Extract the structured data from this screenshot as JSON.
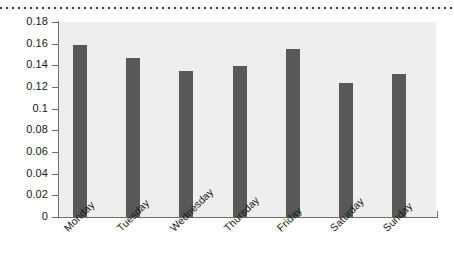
{
  "decor": {
    "top_rule_name": "dotted-rule"
  },
  "chart_data": {
    "type": "bar",
    "title": "",
    "subtitle": "",
    "xlabel": "",
    "ylabel": "",
    "categories": [
      "Monday",
      "Tuesday",
      "Wednesday",
      "Thursday",
      "Friday",
      "Saturday",
      "Sunday"
    ],
    "values": [
      0.159,
      0.147,
      0.135,
      0.139,
      0.155,
      0.124,
      0.132
    ],
    "ylim": [
      0,
      0.18
    ],
    "ytick_labels": [
      "0",
      "0.02",
      "0.04",
      "0.06",
      "0.08",
      "0.1",
      "0.12",
      "0.14",
      "0.16",
      "0.18"
    ],
    "ytick_values": [
      0,
      0.02,
      0.04,
      0.06,
      0.08,
      0.1,
      0.12,
      0.14,
      0.16,
      0.18
    ],
    "grid": false,
    "legend": null,
    "legend_position": "none",
    "bar_color": "#585858",
    "plot_background": "#eeeeee",
    "axis_color": "#6e6e6e",
    "text_color": "#1a1a1a",
    "xtick_label_rotation": 45
  }
}
